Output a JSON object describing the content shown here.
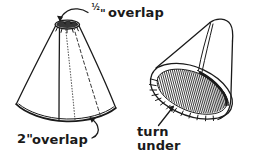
{
  "figure": {
    "background_color": "#ffffff",
    "ink_color": "#1a1a1a",
    "style": "hand-drawn line art"
  },
  "labels": {
    "top_overlap": "½\" overlap",
    "top_overlap_fraction": "½",
    "top_overlap_unit": "\"",
    "top_overlap_word": "overlap",
    "bottom_overlap": "2\" overlap",
    "bottom_overlap_number": "2\"",
    "bottom_overlap_word": "overlap",
    "turn_under_line1": "turn",
    "turn_under_line2": "under"
  },
  "shapes": {
    "left_cone": {
      "name": "upright cone lampshade",
      "apex_note": "small dark scribbled ellipse at top opening",
      "seam_solid": "vertical seam line",
      "seam_dotted": "dotted fold line",
      "seam_dashed": "dashed fold line",
      "bottom_edge": "wide downward arc with double rim"
    },
    "right_cone": {
      "name": "tilted cone showing inside",
      "interior": "dense parallel hatching in elliptical band",
      "rim_tabs": "notched tabs along outer rim",
      "apex": "rounded tip at upper right"
    }
  },
  "annotations": {
    "arrow_top": "curved leader arrow from ½\" label to cone apex",
    "arrow_bottom": "curved arrow from 2\" overlap label to cone bottom edge",
    "arrow_turn_under": "straight diagonal arrow pointing up-right to rim"
  }
}
